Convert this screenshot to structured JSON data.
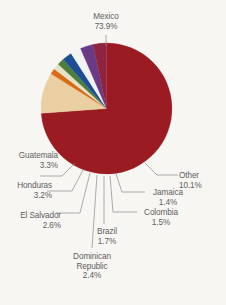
{
  "chart_data": {
    "type": "pie",
    "title": "",
    "categories": [
      "Mexico",
      "Other",
      "Jamaica",
      "Colombia",
      "Brazil",
      "Dominican Republic",
      "El Salvador",
      "Honduras",
      "Guatemala"
    ],
    "values": [
      73.9,
      10.1,
      1.4,
      1.5,
      1.7,
      2.4,
      2.6,
      3.2,
      3.3
    ],
    "unit": "%",
    "legend_position": "none",
    "grid": false,
    "slices": [
      {
        "label": "Mexico",
        "value": 73.9,
        "value_text": "73.9%",
        "color": "#9b1b22"
      },
      {
        "label": "Other",
        "value": 10.1,
        "value_text": "10.1%",
        "color": "#e9cfa2"
      },
      {
        "label": "Jamaica",
        "value": 1.4,
        "value_text": "1.4%",
        "color": "#d96b14"
      },
      {
        "label": "Colombia",
        "value": 1.5,
        "value_text": "1.5%",
        "color": "#e4e3c8"
      },
      {
        "label": "Brazil",
        "value": 1.7,
        "value_text": "1.7%",
        "color": "#4f7d3a"
      },
      {
        "label": "Dominican Republic",
        "value": 2.4,
        "value_text": "2.4%",
        "color": "#1c4f96"
      },
      {
        "label": "El Salvador",
        "value": 2.6,
        "value_text": "2.6%",
        "color": "#f2f2f0"
      },
      {
        "label": "Honduras",
        "value": 3.2,
        "value_text": "3.2%",
        "color": "#6b3a86"
      },
      {
        "label": "Guatemala",
        "value": 3.3,
        "value_text": "3.3%",
        "color": "#8f2440"
      }
    ]
  },
  "labels": {
    "mexico": {
      "name": "Mexico",
      "pct": "73.9%"
    },
    "other": {
      "name": "Other",
      "pct": "10.1%"
    },
    "jamaica": {
      "name": "Jamaica",
      "pct": "1.4%"
    },
    "colombia": {
      "name": "Colombia",
      "pct": "1.5%"
    },
    "brazil": {
      "name": "Brazil",
      "pct": "1.7%"
    },
    "dominican": {
      "name1": "Dominican",
      "name2": "Republic",
      "pct": "2.4%"
    },
    "elsalvador": {
      "name": "El Salvador",
      "pct": "2.6%"
    },
    "honduras": {
      "name": "Honduras",
      "pct": "3.2%"
    },
    "guatemala": {
      "name": "Guatemala",
      "pct": "3.3%"
    }
  },
  "colors": {
    "background": "#f8f6f3",
    "text": "#5e5e5e",
    "leader": "#8a8a8a",
    "accent": "#9b1b22"
  }
}
